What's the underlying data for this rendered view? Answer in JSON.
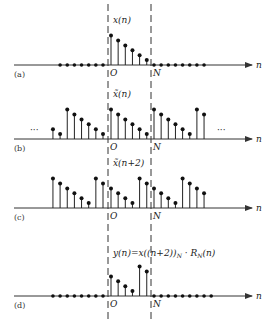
{
  "figure": {
    "axis_variable": "n",
    "origin_label": "O",
    "period_label": "N",
    "ellipsis": "···",
    "panels": [
      {
        "id": "a",
        "tag": "(a)",
        "signal_label": "x(n)",
        "zero_dots_before": 7,
        "zero_dots_after": 8,
        "stems": [
          {
            "n": 0,
            "value": 6
          },
          {
            "n": 1,
            "value": 5
          },
          {
            "n": 2,
            "value": 4
          },
          {
            "n": 3,
            "value": 3
          },
          {
            "n": 4,
            "value": 2
          },
          {
            "n": 5,
            "value": 1
          }
        ],
        "ellipsis_left": false,
        "ellipsis_right": false
      },
      {
        "id": "b",
        "tag": "(b)",
        "signal_label": "x̃(n)",
        "zero_dots_before": 0,
        "zero_dots_after": 0,
        "stems": [
          {
            "n": -8,
            "value": 2
          },
          {
            "n": -7,
            "value": 1
          },
          {
            "n": -6,
            "value": 6
          },
          {
            "n": -5,
            "value": 5
          },
          {
            "n": -4,
            "value": 4
          },
          {
            "n": -3,
            "value": 3
          },
          {
            "n": -2,
            "value": 2
          },
          {
            "n": -1,
            "value": 1
          },
          {
            "n": 0,
            "value": 6
          },
          {
            "n": 1,
            "value": 5
          },
          {
            "n": 2,
            "value": 4
          },
          {
            "n": 3,
            "value": 3
          },
          {
            "n": 4,
            "value": 2
          },
          {
            "n": 5,
            "value": 1
          },
          {
            "n": 6,
            "value": 6
          },
          {
            "n": 7,
            "value": 5
          },
          {
            "n": 8,
            "value": 4
          },
          {
            "n": 9,
            "value": 3
          },
          {
            "n": 10,
            "value": 2
          },
          {
            "n": 11,
            "value": 1
          },
          {
            "n": 12,
            "value": 6
          },
          {
            "n": 13,
            "value": 5
          }
        ],
        "ellipsis_left": true,
        "ellipsis_right": true
      },
      {
        "id": "c",
        "tag": "(c)",
        "signal_label": "x̃(n+2)",
        "zero_dots_before": 0,
        "zero_dots_after": 0,
        "stems": [
          {
            "n": -8,
            "value": 6
          },
          {
            "n": -7,
            "value": 5
          },
          {
            "n": -6,
            "value": 4
          },
          {
            "n": -5,
            "value": 3
          },
          {
            "n": -4,
            "value": 2
          },
          {
            "n": -3,
            "value": 1
          },
          {
            "n": -2,
            "value": 6
          },
          {
            "n": -1,
            "value": 5
          },
          {
            "n": 0,
            "value": 4
          },
          {
            "n": 1,
            "value": 3
          },
          {
            "n": 2,
            "value": 2
          },
          {
            "n": 3,
            "value": 1
          },
          {
            "n": 4,
            "value": 6
          },
          {
            "n": 5,
            "value": 5
          },
          {
            "n": 6,
            "value": 4
          },
          {
            "n": 7,
            "value": 3
          },
          {
            "n": 8,
            "value": 2
          },
          {
            "n": 9,
            "value": 1
          },
          {
            "n": 10,
            "value": 6
          },
          {
            "n": 11,
            "value": 5
          },
          {
            "n": 12,
            "value": 4
          },
          {
            "n": 13,
            "value": 3
          }
        ],
        "ellipsis_left": false,
        "ellipsis_right": false
      },
      {
        "id": "d",
        "tag": "(d)",
        "signal_label": "y(n)=x((n+2))N · RN(n)",
        "signal_label_parts": {
          "main": "y(n)=x((n+2))",
          "sub1": "N",
          "mid": " · R",
          "sub2": "N",
          "tail": "(n)"
        },
        "zero_dots_before": 8,
        "zero_dots_after": 9,
        "stems": [
          {
            "n": 0,
            "value": 4
          },
          {
            "n": 1,
            "value": 3
          },
          {
            "n": 2,
            "value": 2
          },
          {
            "n": 3,
            "value": 1
          },
          {
            "n": 4,
            "value": 6
          },
          {
            "n": 5,
            "value": 5
          }
        ],
        "ellipsis_left": false,
        "ellipsis_right": false
      }
    ]
  }
}
